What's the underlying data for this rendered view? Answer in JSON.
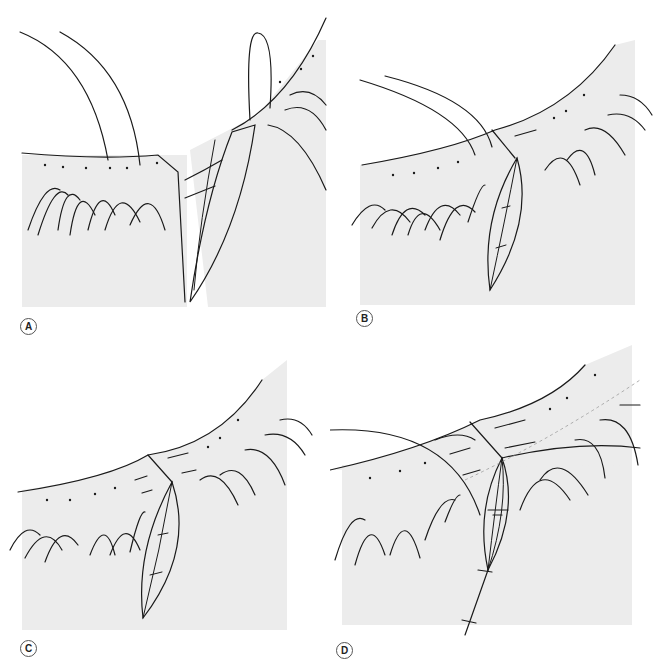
{
  "figure": {
    "type": "surgical-illustration",
    "colors": {
      "skin": "#ececec",
      "wound": "#9d9d9d",
      "wound_inner": "#c8c8c8",
      "ink": "#1a1a1a",
      "background": "#ffffff"
    },
    "panels": [
      {
        "id": "A",
        "label": "A",
        "description": "Lid margin wound edges apposed with vertical mattress suture through gray line; tarsus exposed"
      },
      {
        "id": "B",
        "label": "B",
        "description": "Margin sutures placed; tarsal sutures tied in wound"
      },
      {
        "id": "C",
        "label": "C",
        "description": "Margin sutures tied with ends left long"
      },
      {
        "id": "D",
        "label": "D",
        "description": "Long suture ends incorporated under skin sutures"
      }
    ]
  }
}
